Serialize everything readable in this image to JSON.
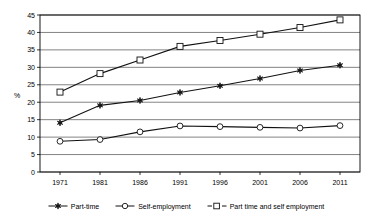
{
  "chart_data": {
    "type": "line",
    "title": "",
    "subtitle": "",
    "xlabel": "",
    "ylabel": "%",
    "categories": [
      "1971",
      "1981",
      "1986",
      "1991",
      "1996",
      "2001",
      "2006",
      "2011"
    ],
    "ylim": [
      0,
      45
    ],
    "ytick_step": 5,
    "yticks": [
      "0",
      "5",
      "10",
      "15",
      "20",
      "25",
      "30",
      "35",
      "40",
      "45"
    ],
    "grid": "horizontal",
    "legend_position": "bottom",
    "series": [
      {
        "name": "Part-time",
        "marker": "star-filled",
        "line_style": "solid",
        "color": "#111111",
        "values": [
          14.1,
          19.1,
          20.5,
          22.8,
          24.7,
          26.8,
          29.1,
          30.6
        ]
      },
      {
        "name": "Self-employment",
        "marker": "circle-open",
        "line_style": "solid",
        "color": "#111111",
        "values": [
          8.8,
          9.3,
          11.5,
          13.2,
          13.0,
          12.8,
          12.6,
          13.3
        ]
      },
      {
        "name": "Part time and self employment",
        "marker": "square-open",
        "line_style": "dashed-legend",
        "color": "#111111",
        "values": [
          22.9,
          28.2,
          32.1,
          36.0,
          37.7,
          39.5,
          41.4,
          43.6
        ]
      }
    ]
  },
  "legend": {
    "items": [
      {
        "label": "Part-time",
        "marker": "star-filled"
      },
      {
        "label": "Self-employment",
        "marker": "circle-open"
      },
      {
        "label": "Part time and self employment",
        "marker": "square-open"
      }
    ]
  },
  "colors": {
    "ink": "#111111",
    "grid": "#4d4d4d",
    "background": "#ffffff"
  }
}
